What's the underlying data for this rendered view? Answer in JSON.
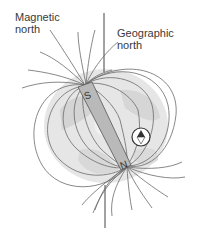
{
  "labels": {
    "magnetic_north": [
      "Magnetic",
      "north"
    ],
    "geographic_north": [
      "Geographic",
      "north"
    ]
  },
  "magnet": {
    "south_pole_label": "S",
    "north_pole_label": "N",
    "color": "#b9b9b9"
  },
  "compass": {
    "icon": "compass-icon",
    "needle_color": "#333333"
  },
  "colors": {
    "field_lines": "#6a6a6a",
    "globe_fill": "#e3e3e3",
    "globe_patches": "#d0d0d0",
    "axis_line": "#444444"
  }
}
